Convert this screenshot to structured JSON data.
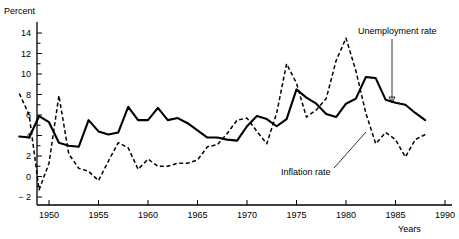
{
  "chart_data": {
    "type": "line",
    "title": "",
    "xlabel": "Years",
    "ylabel": "Percent",
    "xlim": [
      1947,
      1990
    ],
    "ylim": [
      -2,
      15
    ],
    "xticks": [
      1950,
      1955,
      1960,
      1965,
      1970,
      1975,
      1980,
      1985,
      1990
    ],
    "xtick_labels": [
      "1950",
      "1955",
      "1960",
      "1965",
      "1970",
      "1975",
      "1980",
      "1985",
      "1990"
    ],
    "yticks": [
      -2,
      0,
      2,
      4,
      6,
      8,
      10,
      12,
      14
    ],
    "ytick_labels": [
      "− 2",
      "0",
      "2",
      "4",
      "6",
      "8",
      "10",
      "12",
      "14"
    ],
    "ytick_minor_step": 1,
    "grid": false,
    "legend_position": "annotations",
    "x": [
      1947,
      1948,
      1949,
      1950,
      1951,
      1952,
      1953,
      1954,
      1955,
      1956,
      1957,
      1958,
      1959,
      1960,
      1961,
      1962,
      1963,
      1964,
      1965,
      1966,
      1967,
      1968,
      1969,
      1970,
      1971,
      1972,
      1973,
      1974,
      1975,
      1976,
      1977,
      1978,
      1979,
      1980,
      1981,
      1982,
      1983,
      1984,
      1985,
      1986,
      1987,
      1988
    ],
    "series": [
      {
        "name": "Unemployment rate",
        "style": "solid",
        "values": [
          3.9,
          3.8,
          5.9,
          5.3,
          3.3,
          3.0,
          2.9,
          5.5,
          4.4,
          4.1,
          4.3,
          6.8,
          5.5,
          5.5,
          6.7,
          5.5,
          5.7,
          5.2,
          4.5,
          3.8,
          3.8,
          3.6,
          3.5,
          4.9,
          5.9,
          5.6,
          4.9,
          5.6,
          8.5,
          7.7,
          7.1,
          6.1,
          5.8,
          7.1,
          7.6,
          9.7,
          9.6,
          7.5,
          7.2,
          7.0,
          6.2,
          5.5
        ]
      },
      {
        "name": "Inflation rate",
        "style": "dashed",
        "values": [
          8.1,
          6.0,
          -1.3,
          1.3,
          7.9,
          2.2,
          0.8,
          0.5,
          -0.4,
          1.5,
          3.3,
          2.8,
          0.7,
          1.7,
          1.0,
          1.0,
          1.3,
          1.3,
          1.6,
          2.9,
          3.1,
          4.2,
          5.5,
          5.7,
          4.4,
          3.2,
          6.2,
          11.0,
          9.1,
          5.8,
          6.5,
          7.6,
          11.3,
          13.5,
          10.3,
          6.2,
          3.2,
          4.3,
          3.6,
          1.9,
          3.6,
          4.1
        ]
      }
    ],
    "annotations": [
      {
        "text": "Unemployment rate",
        "target_x": 1983,
        "target_y": 8.0
      },
      {
        "text": "Inflation rate",
        "target_x": 1982,
        "target_y": 6.2
      }
    ]
  }
}
